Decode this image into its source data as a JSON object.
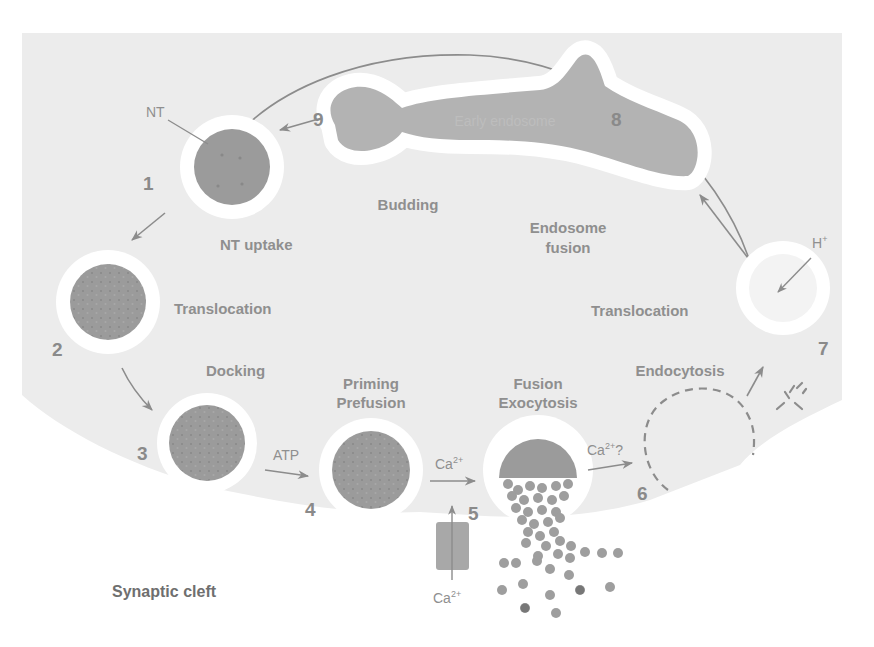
{
  "figure": {
    "colors": {
      "terminal": "#ececec",
      "vesicle_halo": "#ffffff",
      "vesicle_fill": "#9b9b9b",
      "endosome_fill": "#b3b3b3",
      "arrow": "#8c8c8c",
      "text": "#8f8f8f",
      "cleft_text": "#6f6f6f"
    },
    "regions": {
      "cleft_label": "Synaptic cleft"
    },
    "steps": [
      {
        "number": "1",
        "label": "NT uptake"
      },
      {
        "number": "2",
        "label": "Translocation"
      },
      {
        "number": "3",
        "label": "Docking"
      },
      {
        "number": "4",
        "label_line1": "Priming",
        "label_line2": "Prefusion"
      },
      {
        "number": "5",
        "label_line1": "Fusion",
        "label_line2": "Exocytosis"
      },
      {
        "number": "6",
        "label": "Endocytosis"
      },
      {
        "number": "7",
        "label": "Translocation"
      },
      {
        "number": "8",
        "label_line1": "Endosome",
        "label_line2": "fusion"
      },
      {
        "number": "9",
        "label": "Budding"
      }
    ],
    "annotations": {
      "nt": "NT",
      "early_endosome": "Early endosome",
      "atp": "ATP",
      "ca_step4_5": "Ca",
      "ca_step4_5_sup": "2+",
      "ca_step5_6": "Ca",
      "ca_step5_6_sup": "2+",
      "ca_step5_6_q": "?",
      "ca_channel": "Ca",
      "ca_channel_sup": "2+",
      "proton": "H",
      "proton_sup": "+"
    }
  }
}
